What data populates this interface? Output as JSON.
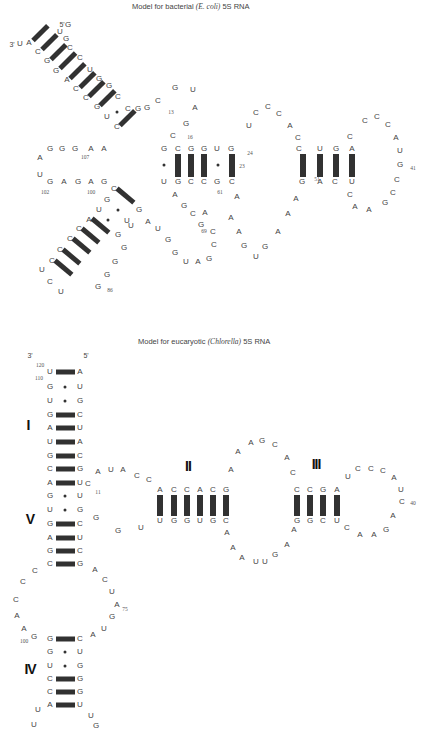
{
  "bacterial": {
    "title_prefix": "Model for bacterial ",
    "title_species": "(E. coli)",
    "title_suffix": " 5S RNA",
    "end3": "3'",
    "end5": "5'",
    "nucleotides": [
      [
        "U",
        60,
        32
      ],
      [
        "G",
        68,
        25
      ],
      [
        "U",
        20,
        44
      ],
      [
        "A",
        29,
        43
      ],
      [
        "C",
        38,
        52
      ],
      [
        "G",
        47,
        61
      ],
      [
        "G",
        56,
        71
      ],
      [
        "A",
        67,
        80
      ],
      [
        "C",
        76,
        89
      ],
      [
        "C",
        86,
        98
      ],
      [
        "G",
        97,
        107
      ],
      [
        "U",
        107,
        117
      ],
      [
        "C",
        117,
        127
      ],
      [
        "G",
        66,
        39
      ],
      [
        "C",
        70,
        48
      ],
      [
        "C",
        80,
        58
      ],
      [
        "U",
        90,
        70
      ],
      [
        "G",
        99,
        79
      ],
      [
        "G",
        109,
        86
      ],
      [
        "C",
        118,
        97
      ],
      [
        "G",
        138,
        109
      ],
      [
        "C",
        128,
        109
      ],
      [
        "G",
        147,
        108
      ],
      [
        "C",
        158,
        101
      ],
      [
        "G",
        175,
        88
      ],
      [
        "U",
        193,
        90
      ],
      [
        "A",
        195,
        108
      ],
      [
        "G",
        186,
        124
      ],
      [
        "C",
        173,
        136
      ],
      [
        "A",
        40,
        158
      ],
      [
        "G",
        50,
        149
      ],
      [
        "G",
        62,
        149
      ],
      [
        "G",
        75,
        149
      ],
      [
        "A",
        91,
        149
      ],
      [
        "A",
        104,
        149
      ],
      [
        "U",
        40,
        175
      ],
      [
        "G",
        50,
        182
      ],
      [
        "A",
        64,
        182
      ],
      [
        "G",
        78,
        182
      ],
      [
        "A",
        91,
        182
      ],
      [
        "G",
        104,
        182
      ],
      [
        "G",
        164,
        149
      ],
      [
        "C",
        178,
        149
      ],
      [
        "G",
        191,
        149
      ],
      [
        "G",
        204,
        149
      ],
      [
        "U",
        217,
        149
      ],
      [
        "G",
        231,
        149
      ],
      [
        "U",
        164,
        182
      ],
      [
        "G",
        178,
        182
      ],
      [
        "C",
        191,
        182
      ],
      [
        "C",
        204,
        182
      ],
      [
        "G",
        217,
        182
      ],
      [
        "C",
        232,
        182
      ],
      [
        "U",
        249,
        126
      ],
      [
        "C",
        256,
        113
      ],
      [
        "C",
        268,
        107
      ],
      [
        "C",
        279,
        114
      ],
      [
        "A",
        290,
        126
      ],
      [
        "C",
        298,
        138
      ],
      [
        "C",
        299,
        149
      ],
      [
        "U",
        320,
        149
      ],
      [
        "G",
        336,
        149
      ],
      [
        "A",
        352,
        149
      ],
      [
        "C",
        350,
        137
      ],
      [
        "C",
        365,
        121
      ],
      [
        "C",
        377,
        117
      ],
      [
        "C",
        388,
        125
      ],
      [
        "A",
        396,
        138
      ],
      [
        "U",
        400,
        151
      ],
      [
        "G",
        400,
        165
      ],
      [
        "C",
        397,
        180
      ],
      [
        "C",
        393,
        193
      ],
      [
        "G",
        385,
        203
      ],
      [
        "A",
        369,
        210
      ],
      [
        "A",
        355,
        207
      ],
      [
        "C",
        350,
        195
      ],
      [
        "G",
        302,
        182
      ],
      [
        "A",
        320,
        182
      ],
      [
        "C",
        335,
        182
      ],
      [
        "U",
        352,
        182
      ],
      [
        "A",
        296,
        199
      ],
      [
        "A",
        288,
        214
      ],
      [
        "A",
        278,
        232
      ],
      [
        "G",
        265,
        247
      ],
      [
        "U",
        256,
        257
      ],
      [
        "G",
        244,
        246
      ],
      [
        "A",
        239,
        232
      ],
      [
        "A",
        231,
        218
      ],
      [
        "A",
        237,
        197
      ],
      [
        "A",
        205,
        213
      ],
      [
        "A",
        175,
        195
      ],
      [
        "G",
        184,
        206
      ],
      [
        "C",
        193,
        214
      ],
      [
        "G",
        201,
        225
      ],
      [
        "C",
        213,
        232
      ],
      [
        "C",
        214,
        245
      ],
      [
        "G",
        209,
        259
      ],
      [
        "A",
        198,
        262
      ],
      [
        "U",
        186,
        262
      ],
      [
        "G",
        175,
        253
      ],
      [
        "G",
        168,
        240
      ],
      [
        "U",
        158,
        229
      ],
      [
        "A",
        148,
        222
      ],
      [
        "U",
        127,
        221
      ],
      [
        "G",
        118,
        235
      ],
      [
        "C",
        114,
        189
      ],
      [
        "G",
        107,
        200
      ],
      [
        "U",
        99,
        210
      ],
      [
        "A",
        89,
        220
      ],
      [
        "C",
        79,
        229
      ],
      [
        "C",
        70,
        239
      ],
      [
        "C",
        60,
        250
      ],
      [
        "C",
        52,
        261
      ],
      [
        "U",
        42,
        270
      ],
      [
        "C",
        50,
        282
      ],
      [
        "U",
        61,
        292
      ],
      [
        "G",
        139,
        210
      ],
      [
        "U",
        131,
        226
      ],
      [
        "G",
        124,
        248
      ],
      [
        "G",
        115,
        262
      ],
      [
        "G",
        107,
        275
      ],
      [
        "G",
        98,
        287
      ]
    ],
    "numbers": [
      [
        "13",
        171,
        112
      ],
      [
        "16",
        190,
        137
      ],
      [
        "24",
        250,
        153
      ],
      [
        "23",
        242,
        166
      ],
      [
        "61",
        220,
        192
      ],
      [
        "51",
        317,
        179
      ],
      [
        "41",
        413,
        168
      ],
      [
        "69",
        204,
        231
      ],
      [
        "107",
        85,
        157
      ],
      [
        "102",
        45,
        192
      ],
      [
        "100",
        91,
        192
      ],
      [
        "86",
        110,
        290
      ]
    ],
    "ends": [
      [
        "3'",
        12,
        44
      ],
      [
        "5'",
        62,
        24
      ]
    ]
  },
  "eukaryotic": {
    "title_prefix": "Model for eucaryotic ",
    "title_species": "(Chlorella)",
    "title_suffix": " 5S RNA",
    "nucleotides": [
      [
        "U",
        50,
        372
      ],
      [
        "G",
        50,
        387
      ],
      [
        "U",
        50,
        401
      ],
      [
        "G",
        50,
        415
      ],
      [
        "A",
        50,
        428
      ],
      [
        "U",
        50,
        442
      ],
      [
        "G",
        50,
        456
      ],
      [
        "C",
        50,
        469
      ],
      [
        "A",
        50,
        483
      ],
      [
        "G",
        50,
        496
      ],
      [
        "U",
        50,
        510
      ],
      [
        "G",
        50,
        524
      ],
      [
        "A",
        50,
        538
      ],
      [
        "G",
        50,
        551
      ],
      [
        "C",
        50,
        564
      ],
      [
        "A",
        80,
        372
      ],
      [
        "U",
        80,
        387
      ],
      [
        "G",
        80,
        401
      ],
      [
        "C",
        80,
        415
      ],
      [
        "U",
        80,
        428
      ],
      [
        "A",
        80,
        442
      ],
      [
        "C",
        80,
        456
      ],
      [
        "G",
        80,
        469
      ],
      [
        "U",
        80,
        483
      ],
      [
        "U",
        80,
        496
      ],
      [
        "G",
        80,
        510
      ],
      [
        "C",
        80,
        524
      ],
      [
        "U",
        80,
        538
      ],
      [
        "C",
        80,
        551
      ],
      [
        "G",
        80,
        564
      ],
      [
        "C",
        88,
        484
      ],
      [
        "A",
        98,
        472
      ],
      [
        "U",
        111,
        470
      ],
      [
        "A",
        123,
        470
      ],
      [
        "C",
        137,
        476
      ],
      [
        "C",
        149,
        480
      ],
      [
        "A",
        160,
        490
      ],
      [
        "C",
        174,
        490
      ],
      [
        "C",
        187,
        490
      ],
      [
        "A",
        200,
        490
      ],
      [
        "C",
        213,
        490
      ],
      [
        "G",
        226,
        490
      ],
      [
        "U",
        160,
        521
      ],
      [
        "G",
        174,
        521
      ],
      [
        "G",
        187,
        521
      ],
      [
        "U",
        200,
        521
      ],
      [
        "G",
        213,
        521
      ],
      [
        "C",
        226,
        521
      ],
      [
        "U",
        141,
        528
      ],
      [
        "G",
        118,
        531
      ],
      [
        "G",
        96,
        518
      ],
      [
        "A",
        231,
        470
      ],
      [
        "A",
        238,
        452
      ],
      [
        "A",
        251,
        443
      ],
      [
        "G",
        262,
        441
      ],
      [
        "C",
        275,
        445
      ],
      [
        "A",
        287,
        458
      ],
      [
        "C",
        293,
        473
      ],
      [
        "C",
        297,
        490
      ],
      [
        "C",
        310,
        490
      ],
      [
        "G",
        323,
        490
      ],
      [
        "A",
        337,
        490
      ],
      [
        "G",
        297,
        521
      ],
      [
        "G",
        310,
        521
      ],
      [
        "C",
        323,
        521
      ],
      [
        "U",
        337,
        521
      ],
      [
        "U",
        348,
        477
      ],
      [
        "C",
        358,
        469
      ],
      [
        "C",
        371,
        469
      ],
      [
        "C",
        383,
        471
      ],
      [
        "A",
        394,
        478
      ],
      [
        "U",
        401,
        490
      ],
      [
        "C",
        402,
        502
      ],
      [
        "A",
        393,
        516
      ],
      [
        "G",
        386,
        530
      ],
      [
        "A",
        374,
        535
      ],
      [
        "A",
        360,
        535
      ],
      [
        "C",
        347,
        528
      ],
      [
        "A",
        227,
        533
      ],
      [
        "A",
        233,
        548
      ],
      [
        "A",
        242,
        558
      ],
      [
        "U",
        256,
        562
      ],
      [
        "U",
        265,
        562
      ],
      [
        "G",
        275,
        555
      ],
      [
        "A",
        287,
        545
      ],
      [
        "A",
        294,
        530
      ],
      [
        "A",
        95,
        570
      ],
      [
        "C",
        105,
        580
      ],
      [
        "U",
        112,
        592
      ],
      [
        "A",
        117,
        605
      ],
      [
        "G",
        112,
        617
      ],
      [
        "U",
        104,
        629
      ],
      [
        "A",
        93,
        635
      ],
      [
        "C",
        35,
        571
      ],
      [
        "C",
        23,
        582
      ],
      [
        "C",
        16,
        600
      ],
      [
        "A",
        17,
        616
      ],
      [
        "A",
        24,
        629
      ],
      [
        "G",
        34,
        637
      ],
      [
        "G",
        50,
        639
      ],
      [
        "G",
        50,
        652
      ],
      [
        "U",
        50,
        666
      ],
      [
        "C",
        50,
        679
      ],
      [
        "C",
        50,
        692
      ],
      [
        "A",
        50,
        705
      ],
      [
        "C",
        80,
        639
      ],
      [
        "U",
        80,
        652
      ],
      [
        "G",
        80,
        666
      ],
      [
        "G",
        80,
        679
      ],
      [
        "G",
        80,
        692
      ],
      [
        "U",
        80,
        705
      ],
      [
        "U",
        38,
        710
      ],
      [
        "U",
        34,
        725
      ],
      [
        "U",
        91,
        716
      ],
      [
        "G",
        96,
        726
      ]
    ],
    "numbers": [
      [
        "120",
        40,
        365
      ],
      [
        "110",
        39,
        378
      ],
      [
        "11",
        98,
        492
      ],
      [
        "75",
        125,
        609
      ],
      [
        "100",
        24,
        641
      ],
      [
        "40",
        413,
        503
      ]
    ],
    "ends": [
      [
        "3'",
        30,
        355
      ],
      [
        "5'",
        86,
        355
      ]
    ],
    "domains": [
      [
        "I",
        28,
        425
      ],
      [
        "V",
        30,
        519
      ],
      [
        "IV",
        30,
        669
      ],
      [
        "II",
        188,
        466
      ],
      [
        "III",
        316,
        464
      ]
    ]
  },
  "colors": {
    "text": "#444444",
    "bond": "#222222",
    "roman": "#111111"
  }
}
